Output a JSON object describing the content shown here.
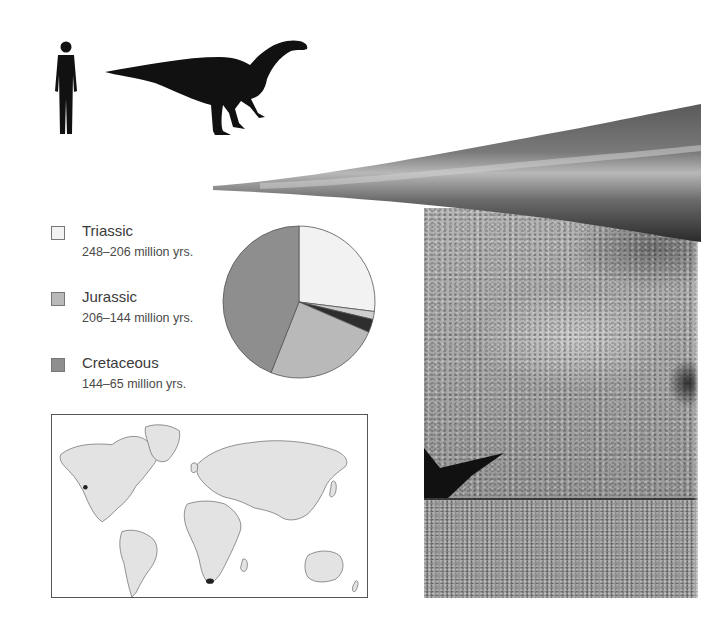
{
  "figure": {
    "scale_comparison": {
      "human_icon": "human-silhouette",
      "dinosaur_icon": "sauropodomorph-silhouette"
    },
    "legend": {
      "items": [
        {
          "label": "Triassic",
          "range": "248–206 million yrs.",
          "color": "#f2f2f2"
        },
        {
          "label": "Jurassic",
          "range": "206–144 million yrs.",
          "color": "#b9b9b9"
        },
        {
          "label": "Cretaceous",
          "range": "144–65 million yrs.",
          "color": "#8e8e8e"
        }
      ]
    },
    "map": {
      "fossil_sites": [
        {
          "region": "western North America"
        },
        {
          "region": "southern Africa"
        }
      ],
      "land_color": "#e3e3e3",
      "marker_color": "#222222"
    }
  },
  "chart_data": {
    "type": "pie",
    "title": "",
    "slices": [
      {
        "name": "Triassic",
        "value": 27,
        "color": "#f2f2f2"
      },
      {
        "name": "Light segment",
        "value": 1.7,
        "color": "#cfcfcf"
      },
      {
        "name": "Highlighted segment",
        "value": 2.8,
        "color": "#2e2e2e"
      },
      {
        "name": "Jurassic",
        "value": 24.5,
        "color": "#b9b9b9"
      },
      {
        "name": "Cretaceous",
        "value": 44,
        "color": "#8e8e8e"
      }
    ],
    "start_angle_deg": 0,
    "direction": "clockwise",
    "legend_position": "left"
  }
}
